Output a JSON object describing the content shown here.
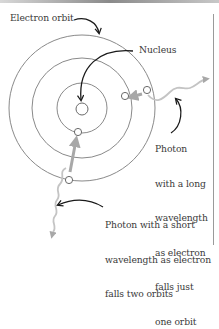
{
  "diagram": {
    "type": "bohr-atom-photon-emission",
    "labels": {
      "electron_orbit": "Electron orbit",
      "nucleus": "Nucleus",
      "long_photon": [
        "Photon",
        "with a long",
        "wavelength",
        "as electron",
        "falls just",
        "one orbit"
      ],
      "short_photon": [
        "Photon with a short",
        "wavelength as electron",
        "falls two orbits"
      ]
    },
    "colors": {
      "orbit": "#8a8a8a",
      "arrow": "#1a1a1a",
      "photon": "#bdbdbd",
      "electron_fill": "#ffffff",
      "text": "#3a3a3a"
    },
    "orbits": [
      {
        "name": "inner",
        "radius": 25
      },
      {
        "name": "middle",
        "radius": 50
      },
      {
        "name": "outer",
        "radius": 73
      }
    ],
    "transitions": [
      {
        "from": "outer",
        "to": "middle",
        "photon": "long wavelength"
      },
      {
        "from": "outer",
        "to": "inner",
        "photon": "short wavelength"
      }
    ]
  }
}
